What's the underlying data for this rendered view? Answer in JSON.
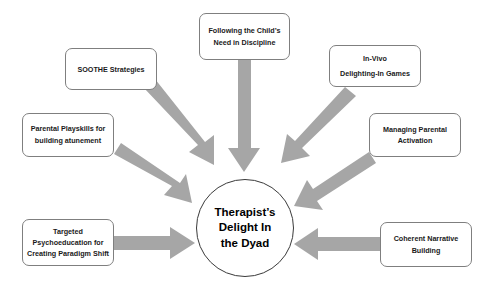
{
  "diagram": {
    "type": "hub-and-spoke",
    "arrow_color": "#a6a6a6",
    "box_border_color": "#7f7f7f",
    "hub_border_color": "#3a3a3a",
    "text_color": "#1a1a1a",
    "background": "#ffffff",
    "hub": {
      "id": "therapists-delight-in-the-dyad",
      "lines": [
        "Therapist’s",
        "Delight In",
        "the Dyad"
      ],
      "shape": "ellipse"
    },
    "nodes": [
      {
        "id": "soothe-strategies",
        "lines": [
          "SOOTHE Strategies"
        ],
        "position": "top-left",
        "arrow_direction": "down-right"
      },
      {
        "id": "following-the-childs-need-in-discipline",
        "lines": [
          "Following the Child’s",
          "Need in Discipline"
        ],
        "position": "top-center",
        "arrow_direction": "down"
      },
      {
        "id": "in-vivo-delighting-in-games",
        "lines": [
          "In-Vivo",
          "Delighting-In Games"
        ],
        "position": "top-right",
        "arrow_direction": "down-left"
      },
      {
        "id": "parental-playskills-for-building-atunement",
        "lines": [
          "Parental Playskills for",
          "building atunement"
        ],
        "position": "middle-left",
        "arrow_direction": "down-right"
      },
      {
        "id": "managing-parental-activation",
        "lines": [
          "Managing Parental",
          "Activation"
        ],
        "position": "middle-right",
        "arrow_direction": "down-left"
      },
      {
        "id": "targeted-psychoeducation-for-creating-paradigm-shift",
        "lines": [
          "Targeted",
          "Psychoeducation for",
          "Creating Paradigm Shift"
        ],
        "position": "bottom-left",
        "arrow_direction": "right"
      },
      {
        "id": "coherent-narrative-building",
        "lines": [
          "Coherent Narrative",
          "Building"
        ],
        "position": "bottom-right",
        "arrow_direction": "left"
      }
    ]
  }
}
